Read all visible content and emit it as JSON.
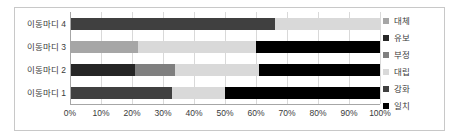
{
  "chart_data": {
    "type": "bar",
    "orientation": "horizontal",
    "stacked": true,
    "stack_mode": "percent",
    "title": "",
    "subtitle": "",
    "xlabel": "",
    "ylabel": "",
    "xlim": [
      0,
      100
    ],
    "grid": true,
    "legend_position": "right",
    "categories": [
      "이동마디 1",
      "이동마디 2",
      "이동마디 3",
      "이동마디 4"
    ],
    "categories_display_order": [
      "이동마디 4",
      "이동마디 3",
      "이동마디 2",
      "이동마디 1"
    ],
    "xticks": [
      "0%",
      "10%",
      "20%",
      "30%",
      "40%",
      "50%",
      "60%",
      "70%",
      "80%",
      "90%",
      "100%"
    ],
    "xtick_values": [
      0,
      10,
      20,
      30,
      40,
      50,
      60,
      70,
      80,
      90,
      100
    ],
    "series": [
      {
        "name": "대체",
        "color": "#a6a6a6",
        "values": [
          0,
          0,
          22,
          0
        ]
      },
      {
        "name": "유보",
        "color": "#262626",
        "values": [
          0,
          21,
          0,
          0
        ]
      },
      {
        "name": "부정",
        "color": "#7f7f7f",
        "values": [
          0,
          13,
          0,
          0
        ]
      },
      {
        "name": "대립",
        "color": "#d9d9d9",
        "values": [
          17,
          27,
          38,
          34
        ]
      },
      {
        "name": "강화",
        "color": "#404040",
        "values": [
          33,
          0,
          0,
          66
        ]
      },
      {
        "name": "일치",
        "color": "#000000",
        "values": [
          50,
          39,
          40,
          0
        ]
      }
    ],
    "bars": [
      {
        "category": "이동마디 4",
        "segments": [
          {
            "series": "강화",
            "value": 66,
            "start": 0,
            "end": 66,
            "color": "#404040"
          },
          {
            "series": "대립",
            "value": 34,
            "start": 66,
            "end": 100,
            "color": "#d9d9d9"
          }
        ]
      },
      {
        "category": "이동마디 3",
        "segments": [
          {
            "series": "대체",
            "value": 22,
            "start": 0,
            "end": 22,
            "color": "#a6a6a6"
          },
          {
            "series": "대립",
            "value": 38,
            "start": 22,
            "end": 60,
            "color": "#d9d9d9"
          },
          {
            "series": "일치",
            "value": 40,
            "start": 60,
            "end": 100,
            "color": "#000000"
          }
        ]
      },
      {
        "category": "이동마디 2",
        "segments": [
          {
            "series": "유보",
            "value": 21,
            "start": 0,
            "end": 21,
            "color": "#262626"
          },
          {
            "series": "부정",
            "value": 13,
            "start": 21,
            "end": 34,
            "color": "#7f7f7f"
          },
          {
            "series": "대립",
            "value": 27,
            "start": 34,
            "end": 61,
            "color": "#d9d9d9"
          },
          {
            "series": "일치",
            "value": 39,
            "start": 61,
            "end": 100,
            "color": "#000000"
          }
        ]
      },
      {
        "category": "이동마디 1",
        "segments": [
          {
            "series": "강화",
            "value": 33,
            "start": 0,
            "end": 33,
            "color": "#404040"
          },
          {
            "series": "대립",
            "value": 17,
            "start": 33,
            "end": 50,
            "color": "#d9d9d9"
          },
          {
            "series": "일치",
            "value": 50,
            "start": 50,
            "end": 100,
            "color": "#000000"
          }
        ]
      }
    ]
  },
  "legend": {
    "items": [
      {
        "label": "대체",
        "color": "#a6a6a6"
      },
      {
        "label": "유보",
        "color": "#262626"
      },
      {
        "label": "부정",
        "color": "#7f7f7f"
      },
      {
        "label": "대립",
        "color": "#d9d9d9"
      },
      {
        "label": "강화",
        "color": "#404040"
      },
      {
        "label": "일치",
        "color": "#000000"
      }
    ]
  },
  "axes": {
    "y_labels": [
      "이동마디 4",
      "이동마디 3",
      "이동마디 2",
      "이동마디 1"
    ],
    "x_labels": [
      "0%",
      "10%",
      "20%",
      "30%",
      "40%",
      "50%",
      "60%",
      "70%",
      "80%",
      "90%",
      "100%"
    ]
  },
  "colors": {
    "plot_background": "#ffffff",
    "frame_border": "#c8c8c8",
    "gridline": "#d9d9d9",
    "axis": "#a6a6a6",
    "text": "#3a3a3a"
  }
}
